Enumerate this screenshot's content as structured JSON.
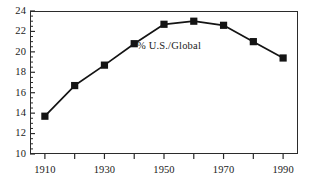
{
  "chart_data": {
    "type": "line",
    "title": "",
    "subtitle": "",
    "xlabel": "",
    "ylabel": "",
    "x": [
      1910,
      1920,
      1930,
      1940,
      1950,
      1960,
      1970,
      1980,
      1990
    ],
    "categories": [
      "1910",
      "1920",
      "1930",
      "1940",
      "1950",
      "1960",
      "1970",
      "1980",
      "1990"
    ],
    "series": [
      {
        "name": "% U.S./Global",
        "values": [
          13.7,
          16.7,
          18.7,
          20.8,
          22.7,
          23.0,
          22.6,
          21.0,
          19.4
        ]
      }
    ],
    "values": [
      13.7,
      16.7,
      18.7,
      20.8,
      22.7,
      23.0,
      22.6,
      21.0,
      19.4
    ],
    "xlim": [
      1905,
      1995
    ],
    "ylim": [
      10,
      24
    ],
    "y_ticks": [
      10,
      12,
      14,
      16,
      18,
      20,
      22,
      24
    ],
    "y_tick_labels": [
      "10",
      "12",
      "14",
      "16",
      "18",
      "20",
      "22",
      "24"
    ],
    "y_minor_tick_step": 0.5,
    "x_ticks": [
      1910,
      1920,
      1930,
      1940,
      1950,
      1960,
      1970,
      1980,
      1990
    ],
    "x_tick_labels": [
      "1910",
      "",
      "1930",
      "",
      "1950",
      "",
      "1970",
      "",
      "1990"
    ],
    "x_labeled_ticks": [
      1910,
      1930,
      1950,
      1970,
      1990
    ],
    "x_labeled_tick_labels": [
      "1910",
      "1930",
      "1950",
      "1970",
      "1990"
    ],
    "grid": false,
    "legend": "none",
    "annotations": [
      {
        "text": "% U.S./Global",
        "x": 1955,
        "y": 20.6
      }
    ],
    "marker": "square",
    "line_color": "#141414",
    "marker_color": "#141414",
    "background_color": "#ffffff",
    "axis_color": "#2b2b2b"
  },
  "annotation_label": "% U.S./Global",
  "axis": {
    "y_labels": [
      "24",
      "22",
      "20",
      "18",
      "16",
      "14",
      "12",
      "10"
    ],
    "x_labels": [
      "1910",
      "1930",
      "1950",
      "1970",
      "1990"
    ]
  }
}
